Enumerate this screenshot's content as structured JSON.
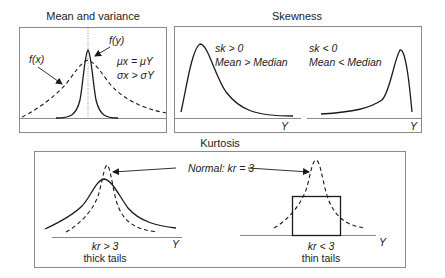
{
  "panels": {
    "mean_variance": {
      "title": "Mean and variance",
      "label_fx": "f(x)",
      "label_fy": "f(y)",
      "relation_mean": "μx = μY",
      "relation_sigma": "σx > σY"
    },
    "skewness": {
      "title": "Skewness",
      "positive": {
        "condition": "sk > 0",
        "description": "Mean > Median",
        "axis_label": "Y"
      },
      "negative": {
        "condition": "sk < 0",
        "description": "Mean < Median",
        "axis_label": "Y"
      }
    },
    "kurtosis": {
      "title": "Kurtosis",
      "normal_label": "Normal: kr = 3",
      "thick": {
        "condition": "kr > 3",
        "description": "thick tails",
        "axis_label": "Y"
      },
      "thin": {
        "condition": "kr < 3",
        "description": "thin tails",
        "axis_label": "Y"
      }
    }
  },
  "colors": {
    "frame": "#8a8a8a",
    "curve": "#1a1a1a",
    "text": "#222222"
  }
}
